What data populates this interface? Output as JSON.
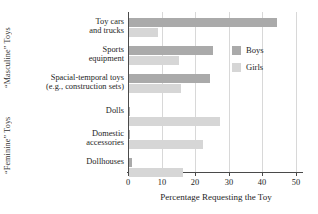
{
  "chart_data": {
    "type": "bar",
    "orientation": "horizontal",
    "title": "",
    "xlabel": "Percentage Requesting the Toy",
    "ylabel": "",
    "xlim": [
      0,
      50
    ],
    "xticks": [
      0,
      10,
      20,
      30,
      40,
      50
    ],
    "grid": true,
    "legend_position": "right-upper",
    "categories": [
      "Toy cars and trucks",
      "Sports equipment",
      "Spacial-temporal toys (e.g., construction sets)",
      "Dolls",
      "Domestic accessories",
      "Dollhouses"
    ],
    "series": [
      {
        "name": "Boys",
        "color": "#aaaaaa",
        "values": [
          44,
          25,
          24,
          0.3,
          0.3,
          1
        ]
      },
      {
        "name": "Girls",
        "color": "#d6d6d6",
        "values": [
          8.5,
          15,
          15.5,
          27,
          22,
          16
        ]
      }
    ],
    "group_labels": [
      {
        "text": "“Masculine” Toys",
        "categories": [
          "Toy cars and trucks",
          "Sports equipment",
          "Spacial-temporal toys (e.g., construction sets)"
        ]
      },
      {
        "text": "“Feminine” Toys",
        "categories": [
          "Dolls",
          "Domestic accessories",
          "Dollhouses"
        ]
      }
    ]
  },
  "axis": {
    "group_masculine": "“Masculine” Toys",
    "group_feminine": "“Feminine” Toys",
    "x_title": "Percentage Requesting the Toy",
    "tick_0": "0",
    "tick_10": "10",
    "tick_20": "20",
    "tick_30": "30",
    "tick_40": "40",
    "tick_50": "50"
  },
  "categories": {
    "c0_line1": "Toy cars",
    "c0_line2": "and trucks",
    "c1_line1": "Sports",
    "c1_line2": "equipment",
    "c2_line1": "Spacial-temporal toys",
    "c2_line2": "(e.g., construction sets)",
    "c3_line1": "Dolls",
    "c4_line1": "Domestic",
    "c4_line2": "accessories",
    "c5_line1": "Dollhouses"
  },
  "legend": {
    "boys": "Boys",
    "girls": "Girls"
  }
}
